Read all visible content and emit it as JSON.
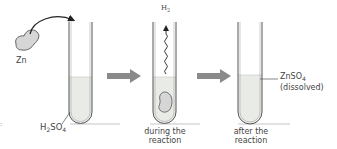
{
  "diagram": {
    "reactant": {
      "label": "Zn"
    },
    "stages": [
      {
        "id": "before",
        "acid_label_main": "H",
        "acid_sub1": "2",
        "acid_mid": "SO",
        "acid_sub2": "4"
      },
      {
        "id": "during",
        "gas_label_main": "H",
        "gas_sub": "2",
        "caption_line1": "during the",
        "caption_line2": "reaction"
      },
      {
        "id": "after",
        "product_main": "ZnSO",
        "product_sub": "4",
        "product_note": "(dissolved)",
        "caption_line1": "after the",
        "caption_line2": "reaction"
      }
    ],
    "arrows": [
      "process-arrow",
      "process-arrow"
    ],
    "colors": {
      "tube_outline": "#555555",
      "liquid": "#e8ebe6",
      "arrow": "#8a8a8a",
      "rock_fill": "#d6d6d6",
      "shadow": "#d9d9d9"
    }
  }
}
